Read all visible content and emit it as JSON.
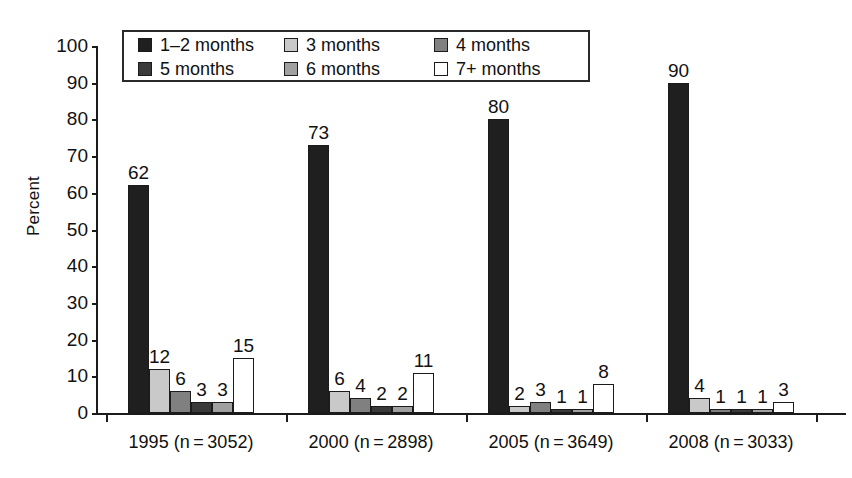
{
  "chart_data": {
    "type": "bar",
    "title": "",
    "subtitle": "",
    "xlabel": "",
    "ylabel": "Percent",
    "ylim": [
      0,
      100
    ],
    "yticks": [
      0,
      10,
      20,
      30,
      40,
      50,
      60,
      70,
      80,
      90,
      100
    ],
    "grid": false,
    "legend_position": "top-inside",
    "categories": [
      "1995 (n = 3052)",
      "2000 (n = 2898)",
      "2005 (n = 3649)",
      "2008 (n = 3033)"
    ],
    "series": [
      {
        "name": "1–2 months",
        "color": "#1f1f1f",
        "values": [
          62,
          73,
          80,
          90
        ]
      },
      {
        "name": "3 months",
        "color": "#c9c9c9",
        "values": [
          12,
          6,
          2,
          4
        ]
      },
      {
        "name": "4 months",
        "color": "#808080",
        "values": [
          6,
          4,
          3,
          1
        ]
      },
      {
        "name": "5 months",
        "color": "#3a3a3a",
        "values": [
          3,
          2,
          1,
          1
        ]
      },
      {
        "name": "6 months",
        "color": "#a0a0a0",
        "values": [
          3,
          2,
          1,
          1
        ]
      },
      {
        "name": "7+ months",
        "color": "#ffffff",
        "values": [
          15,
          11,
          8,
          3
        ]
      }
    ],
    "value_labels": [
      [
        62,
        12,
        6,
        3,
        3,
        15
      ],
      [
        73,
        6,
        4,
        2,
        2,
        11
      ],
      [
        80,
        2,
        3,
        1,
        1,
        8
      ],
      [
        90,
        4,
        1,
        1,
        1,
        3
      ]
    ]
  },
  "axis": {
    "y_title": "Percent",
    "y_tick_labels": [
      "100",
      "90",
      "80",
      "70",
      "60",
      "50",
      "40",
      "30",
      "20",
      "10",
      "0"
    ],
    "x_tick_labels": [
      "1995 (n = 3052)",
      "2000 (n = 2898)",
      "2005 (n = 3649)",
      "2008 (n = 3033)"
    ]
  },
  "legend": {
    "items": [
      {
        "label": "1–2 months",
        "color": "#1f1f1f"
      },
      {
        "label": "3 months",
        "color": "#c9c9c9"
      },
      {
        "label": "4 months",
        "color": "#808080"
      },
      {
        "label": "5 months",
        "color": "#3a3a3a"
      },
      {
        "label": "6 months",
        "color": "#a0a0a0"
      },
      {
        "label": "7+ months",
        "color": "#ffffff"
      }
    ]
  }
}
